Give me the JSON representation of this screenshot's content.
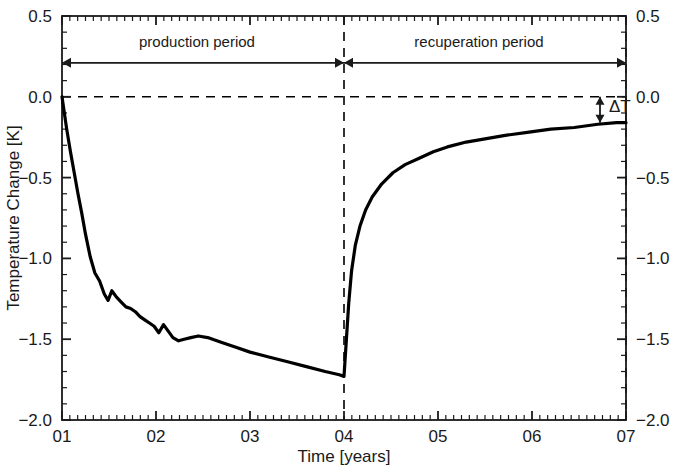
{
  "chart_data": {
    "type": "line",
    "title": "",
    "xlabel": "Time [years]",
    "ylabel": "Temperature Change [K]",
    "xlim": [
      1,
      7
    ],
    "ylim": [
      -2.0,
      0.5
    ],
    "x_tick_labels": [
      "01",
      "02",
      "03",
      "04",
      "05",
      "06",
      "07"
    ],
    "x_tick_values": [
      1,
      2,
      3,
      4,
      5,
      6,
      7
    ],
    "y_tick_labels": [
      "0.5",
      "0.0",
      "-0.5",
      "-1.0",
      "-1.5",
      "-2.0"
    ],
    "y_tick_values": [
      0.5,
      0.0,
      -0.5,
      -1.0,
      -1.5,
      -2.0
    ],
    "y_tick_labels_right": [
      "0.5",
      "0.0",
      "-0.5",
      "-1.0",
      "-1.5",
      "-2.0"
    ],
    "minor_ticks_per_major_x": 12,
    "minor_ticks_per_major_y": 5,
    "grid": false,
    "legend": "none",
    "series": [
      {
        "name": "Temperature Change",
        "color": "#000000",
        "line_width": 3.2,
        "x": [
          1.0,
          1.02,
          1.05,
          1.09,
          1.13,
          1.17,
          1.21,
          1.25,
          1.3,
          1.35,
          1.4,
          1.45,
          1.49,
          1.53,
          1.58,
          1.63,
          1.68,
          1.73,
          1.78,
          1.83,
          1.88,
          1.93,
          1.98,
          2.03,
          2.08,
          2.13,
          2.18,
          2.24,
          2.3,
          2.37,
          2.45,
          2.55,
          2.7,
          2.85,
          3.0,
          3.2,
          3.4,
          3.6,
          3.8,
          3.95,
          4.0,
          4.02,
          4.05,
          4.08,
          4.12,
          4.17,
          4.23,
          4.3,
          4.4,
          4.52,
          4.65,
          4.8,
          4.95,
          5.1,
          5.3,
          5.5,
          5.7,
          5.95,
          6.2,
          6.45,
          6.7,
          6.9,
          7.0
        ],
        "y": [
          0.0,
          -0.08,
          -0.2,
          -0.34,
          -0.47,
          -0.6,
          -0.72,
          -0.85,
          -0.99,
          -1.09,
          -1.14,
          -1.22,
          -1.26,
          -1.2,
          -1.24,
          -1.27,
          -1.3,
          -1.31,
          -1.33,
          -1.36,
          -1.38,
          -1.4,
          -1.42,
          -1.46,
          -1.41,
          -1.45,
          -1.49,
          -1.51,
          -1.5,
          -1.49,
          -1.48,
          -1.49,
          -1.52,
          -1.55,
          -1.58,
          -1.61,
          -1.64,
          -1.67,
          -1.7,
          -1.72,
          -1.73,
          -1.55,
          -1.28,
          -1.08,
          -0.92,
          -0.8,
          -0.7,
          -0.62,
          -0.54,
          -0.47,
          -0.42,
          -0.38,
          -0.34,
          -0.31,
          -0.28,
          -0.26,
          -0.24,
          -0.22,
          -0.2,
          -0.19,
          -0.17,
          -0.16,
          -0.16
        ]
      }
    ],
    "reference_lines": [
      {
        "name": "zero-line",
        "orientation": "horizontal",
        "value": 0.0,
        "style": "dashed"
      },
      {
        "name": "production-end-line",
        "orientation": "vertical",
        "value": 4,
        "style": "dashed"
      },
      {
        "name": "recuperation-end-line",
        "orientation": "vertical",
        "value": 7,
        "style": "dashed"
      }
    ],
    "annotations": [
      {
        "name": "production-period",
        "label": "production period",
        "x_start": 1,
        "x_end": 4,
        "y": 0.21,
        "arrow": "double"
      },
      {
        "name": "recuperation-period",
        "label": "recuperation period",
        "x_start": 4,
        "x_end": 7,
        "y": 0.21,
        "arrow": "double"
      },
      {
        "name": "delta-t",
        "label": "ΔT",
        "x": 7,
        "y_top": 0.0,
        "y_bottom": -0.16,
        "arrow": "double-vertical"
      }
    ]
  },
  "colors": {
    "line": "#000000",
    "axis": "#1a1a1a",
    "background": "#ffffff",
    "text": "#1a1a1a"
  }
}
